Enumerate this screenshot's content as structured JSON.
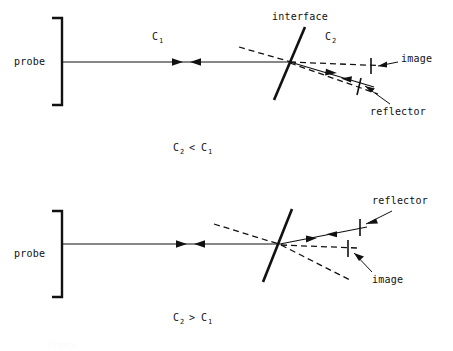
{
  "figure": {
    "background_color": "#ffffff",
    "line_color": "#111111"
  },
  "panels": [
    {
      "id": "panel-top",
      "caption": "C2 < C1",
      "caption_parts": {
        "first": "C",
        "first_sub": "2",
        "operator": "<",
        "second": "C",
        "second_sub": "1"
      },
      "labels": {
        "probe": "probe",
        "medium_1": "C",
        "medium_1_sub": "1",
        "medium_2": "C",
        "medium_2_sub": "2",
        "interface": "interface",
        "image": "image",
        "reflector": "reflector"
      }
    },
    {
      "id": "panel-bottom",
      "caption": "C2 > C1",
      "caption_parts": {
        "first": "C",
        "first_sub": "2",
        "operator": ">",
        "second": "C",
        "second_sub": "1"
      },
      "labels": {
        "probe": "probe",
        "image": "image",
        "reflector": "reflector"
      }
    }
  ],
  "bottom_caption": {
    "text": "Figure"
  }
}
